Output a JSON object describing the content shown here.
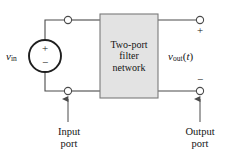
{
  "figure": {
    "type": "circuit-block-diagram",
    "background_color": "#ffffff",
    "line_color": "#3c3c3c",
    "block_fill_color": "#e3e3e3",
    "block_border_color": "#6e6e6e"
  },
  "source": {
    "label_symbol": "v",
    "label_subscript": "in",
    "polarity_plus": "+",
    "polarity_minus": "−"
  },
  "block": {
    "line1": "Two-port",
    "line2": "filter",
    "line3": "network"
  },
  "output": {
    "label_symbol": "v",
    "label_subscript": "out",
    "label_argument_open": "(",
    "label_argument_var": "t",
    "label_argument_close": ")",
    "polarity_plus": "+",
    "polarity_minus": "−"
  },
  "annotations": {
    "input_port_line1": "Input",
    "input_port_line2": "port",
    "output_port_line1": "Output",
    "output_port_line2": "port"
  },
  "terminals": {
    "input_top": "input-top-terminal",
    "input_bottom": "input-bottom-terminal",
    "output_top": "output-top-terminal",
    "output_bottom": "output-bottom-terminal"
  },
  "icons": {
    "input_arrow": "arrow-up-icon",
    "output_arrow": "arrow-up-icon",
    "source": "voltage-source-icon"
  }
}
